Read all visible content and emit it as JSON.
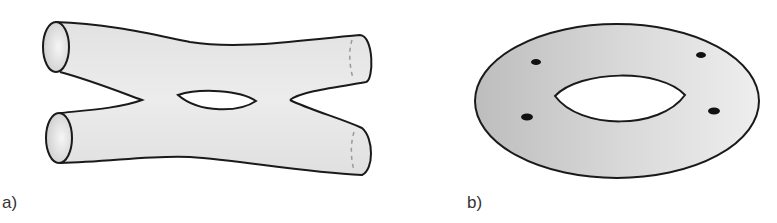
{
  "figures": [
    {
      "id": "a",
      "label": "a)",
      "description": "Genus-one surface with four tube boundaries (X-shaped pants surface with a hole)",
      "fill_color": "#e6e6e6",
      "stroke_color": "#1a1a1a"
    },
    {
      "id": "b",
      "label": "b)",
      "description": "Annulus (flat disk with a hole) with four marked points",
      "fill_color": "#d0d0d0",
      "stroke_color": "#1a1a1a",
      "marked_points": 4
    }
  ]
}
